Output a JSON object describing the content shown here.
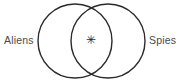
{
  "figure": {
    "type": "venn-diagram",
    "title": "",
    "background_color": "#ffffff",
    "stroke_color": "#2b2b2b",
    "label_color": "#4a4a4a",
    "stroke_width": 1.4
  },
  "sets": {
    "left": {
      "label": "Aliens",
      "label_x": 4,
      "label_y": 44,
      "circle": {
        "cx": 75,
        "cy": 41,
        "r": 37
      }
    },
    "right": {
      "label": "Spies",
      "label_x": 149,
      "label_y": 44,
      "circle": {
        "cx": 108,
        "cy": 41,
        "r": 37
      }
    }
  },
  "intersection": {
    "mark": "✳",
    "mark_x": 91,
    "mark_y": 44,
    "label": ""
  }
}
